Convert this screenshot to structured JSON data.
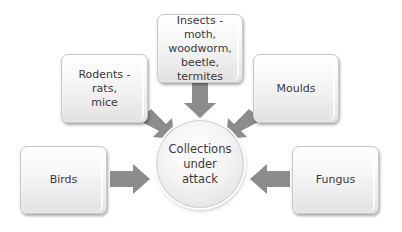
{
  "diagram": {
    "type": "radial-converging",
    "center": {
      "label": "Collections under attack",
      "lines": [
        "Collections",
        "under",
        "attack"
      ]
    },
    "nodes": [
      {
        "id": "insects",
        "label": "Insects - moth, woodworm, beetle, termites",
        "lines": [
          "Insects - moth,",
          "woodworm,",
          "beetle,",
          "termites"
        ]
      },
      {
        "id": "rodents",
        "label": "Rodents - rats, mice",
        "lines": [
          "Rodents - rats,",
          "mice"
        ]
      },
      {
        "id": "moulds",
        "label": "Moulds",
        "lines": [
          "Moulds"
        ]
      },
      {
        "id": "birds",
        "label": "Birds",
        "lines": [
          "Birds"
        ]
      },
      {
        "id": "fungus",
        "label": "Fungus",
        "lines": [
          "Fungus"
        ]
      }
    ],
    "edges": [
      {
        "from": "insects",
        "to": "center"
      },
      {
        "from": "rodents",
        "to": "center"
      },
      {
        "from": "moulds",
        "to": "center"
      },
      {
        "from": "birds",
        "to": "center"
      },
      {
        "from": "fungus",
        "to": "center"
      }
    ],
    "colors": {
      "arrow": "#8c8c8c",
      "box_border": "#c8c8c8",
      "text": "#3a3a3a",
      "background": "#ffffff"
    }
  }
}
